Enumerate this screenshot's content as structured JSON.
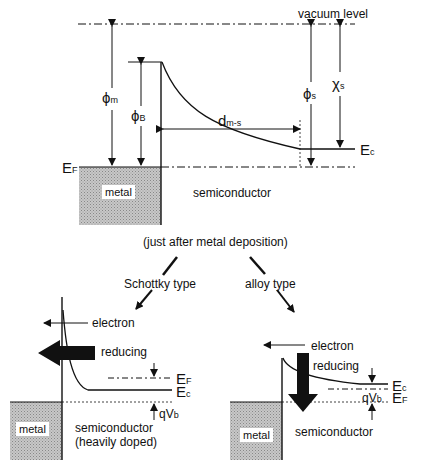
{
  "top": {
    "vacuum_level": "vacuum level",
    "phi_m": "ϕ",
    "phi_m_sub": "m",
    "phi_b": "ϕ",
    "phi_b_sub": "B",
    "phi_s": "ϕ",
    "phi_s_sub": "s",
    "chi_s": "χ",
    "chi_s_sub": "s",
    "d": "d",
    "d_sub": "m-s",
    "ef": "E",
    "ef_sub": "F",
    "ec": "E",
    "ec_sub": "c",
    "metal": "metal",
    "semiconductor": "semiconductor",
    "caption": "(just after metal deposition)"
  },
  "branches": {
    "schottky": "Schottky type",
    "alloy": "alloy type"
  },
  "schottky": {
    "electron": "electron",
    "reducing": "reducing",
    "ef": "E",
    "ef_sub": "F",
    "ec": "E",
    "ec_sub": "c",
    "qvb": "qV",
    "qvb_sub": "b",
    "metal": "metal",
    "semiconductor": "semiconductor",
    "note": "(heavily doped)"
  },
  "alloy": {
    "electron": "electron",
    "reducing": "reducing",
    "ec": "E",
    "ec_sub": "c",
    "ef": "E",
    "ef_sub": "F",
    "qvb": "qV",
    "qvb_sub": "b",
    "metal": "metal",
    "semiconductor": "semiconductor"
  }
}
